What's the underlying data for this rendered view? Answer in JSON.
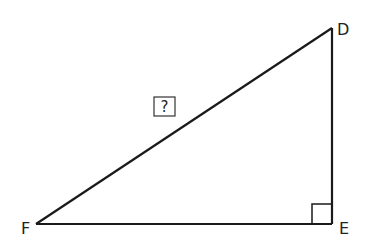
{
  "diagram": {
    "type": "right-triangle",
    "vertices": [
      {
        "name": "D",
        "x": 332,
        "y": 28
      },
      {
        "name": "E",
        "x": 332,
        "y": 224
      },
      {
        "name": "F",
        "x": 36,
        "y": 224
      }
    ],
    "labels": {
      "D": "D",
      "E": "E",
      "F": "F"
    },
    "right_angle_at": "E",
    "unknown_side": {
      "between": [
        "F",
        "D"
      ],
      "label": "?"
    },
    "stroke_color": "#1a1a1a"
  }
}
